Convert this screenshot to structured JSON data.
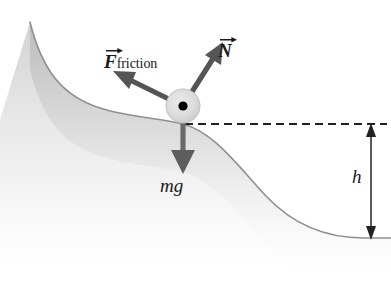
{
  "figure": {
    "background_color": "#ffffff",
    "width": 391,
    "height": 287
  },
  "terrain": {
    "name": "hill-curve",
    "edge_color": "#8a8a8a",
    "fill_color": "#e6e6e6",
    "description": "S-shaped slope descending from upper left to a flat region at lower right"
  },
  "particle": {
    "name": "block-on-slope",
    "body_color": "#d9d9d9",
    "center_dot_color": "#000000",
    "center_x": 183,
    "center_y": 106,
    "radius": 17
  },
  "vectors": [
    {
      "id": "friction",
      "letter": "F",
      "subscript": "friction",
      "color": "#555555",
      "direction": "up-left",
      "from_x": 183,
      "from_y": 106,
      "to_x": 118,
      "to_y": 74
    },
    {
      "id": "normal",
      "letter": "N",
      "subscript": "",
      "color": "#555555",
      "direction": "up-right",
      "from_x": 183,
      "from_y": 106,
      "to_x": 222,
      "to_y": 45
    },
    {
      "id": "weight",
      "letter": "mg",
      "subscript": "",
      "color": "#555555",
      "direction": "down",
      "from_x": 183,
      "from_y": 106,
      "to_x": 183,
      "to_y": 172
    }
  ],
  "labels": {
    "friction": "F",
    "friction_subscript": "friction",
    "normal": "N",
    "weight": "mg",
    "height": "h"
  },
  "reference_line": {
    "name": "dashed-level-line",
    "color": "#222222",
    "y": 124,
    "x_start": 185,
    "x_end": 386,
    "dash": "8 5"
  },
  "height_measure": {
    "name": "height-dimension-arrow",
    "color": "#333333",
    "x": 371,
    "y_top": 126,
    "y_bottom": 238,
    "label": "h"
  }
}
